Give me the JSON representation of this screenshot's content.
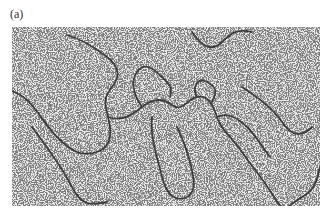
{
  "figure": {
    "panel_label": "(a)",
    "image": {
      "description": "electron micrograph of DNA strands on a speckled background",
      "background_color": "#e9e9e9",
      "speckle_color": "#3a3a3a",
      "strand_color": "#2a2a2a"
    }
  }
}
